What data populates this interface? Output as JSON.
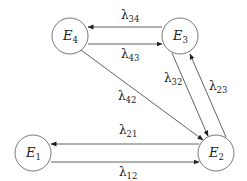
{
  "diagram": {
    "type": "state-transition",
    "nodes": [
      {
        "id": "E1",
        "symbol": "E",
        "subscript": "1",
        "cx": 33,
        "cy": 153,
        "r": 18
      },
      {
        "id": "E2",
        "symbol": "E",
        "subscript": "2",
        "cx": 216,
        "cy": 153,
        "r": 18
      },
      {
        "id": "E3",
        "symbol": "E",
        "subscript": "3",
        "cx": 180,
        "cy": 36,
        "r": 18
      },
      {
        "id": "E4",
        "symbol": "E",
        "subscript": "4",
        "cx": 70,
        "cy": 36,
        "r": 18
      }
    ],
    "edges": [
      {
        "from": "E3",
        "to": "E4",
        "symbol": "λ",
        "subscript": "34",
        "x1": 162,
        "y1": 27,
        "x2": 88,
        "y2": 27,
        "lx": 121,
        "ly": 19
      },
      {
        "from": "E4",
        "to": "E3",
        "symbol": "λ",
        "subscript": "43",
        "x1": 88,
        "y1": 44,
        "x2": 162,
        "y2": 44,
        "lx": 121,
        "ly": 58
      },
      {
        "from": "E4",
        "to": "E2",
        "symbol": "λ",
        "subscript": "42",
        "x1": 81,
        "y1": 50,
        "x2": 203,
        "y2": 140,
        "lx": 118,
        "ly": 100
      },
      {
        "from": "E3",
        "to": "E2",
        "symbol": "λ",
        "subscript": "32",
        "x1": 172,
        "y1": 53,
        "x2": 208,
        "y2": 136,
        "lx": 164,
        "ly": 82
      },
      {
        "from": "E2",
        "to": "E3",
        "symbol": "λ",
        "subscript": "23",
        "x1": 226,
        "y1": 137,
        "x2": 190,
        "y2": 54,
        "lx": 209,
        "ly": 90
      },
      {
        "from": "E2",
        "to": "E1",
        "symbol": "λ",
        "subscript": "21",
        "x1": 199,
        "y1": 144,
        "x2": 51,
        "y2": 144,
        "lx": 119,
        "ly": 134
      },
      {
        "from": "E1",
        "to": "E2",
        "symbol": "λ",
        "subscript": "12",
        "x1": 51,
        "y1": 162,
        "x2": 199,
        "y2": 162,
        "lx": 119,
        "ly": 176
      }
    ]
  }
}
